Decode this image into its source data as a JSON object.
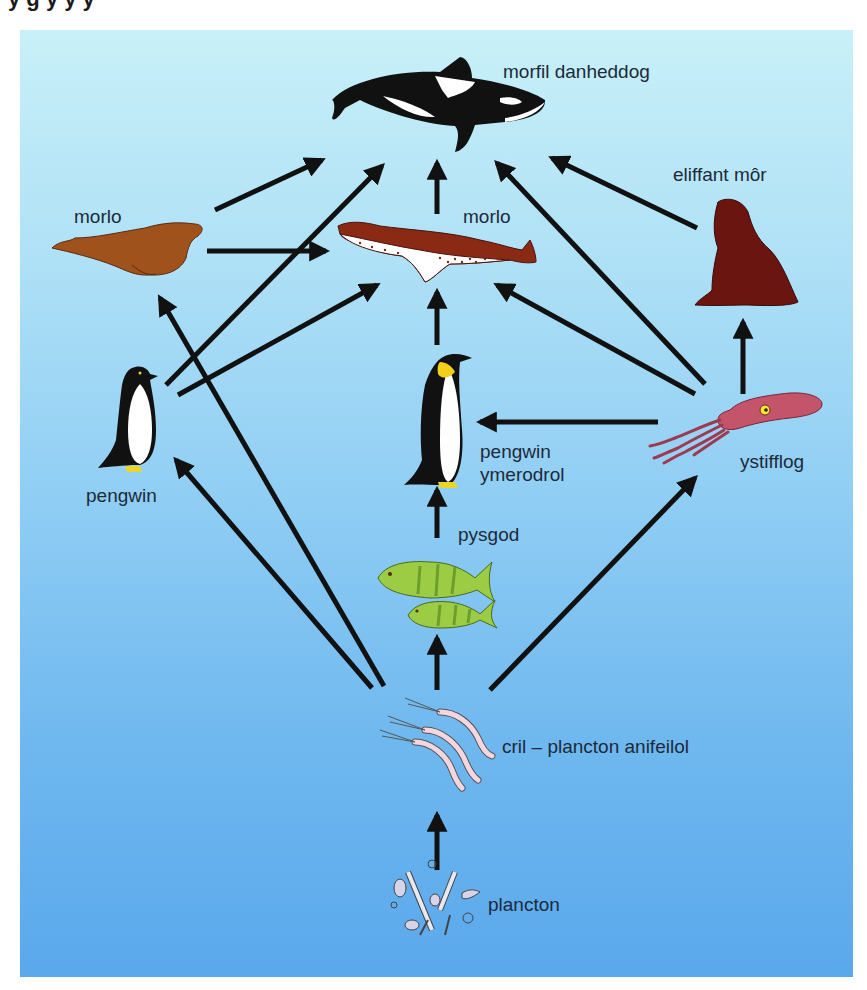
{
  "header": {
    "cut_off_title": "y     g         y y  y"
  },
  "diagram": {
    "background_colors": {
      "top": "#c8f0f8",
      "bottom": "#5aa8ec"
    },
    "arrow_color": "#111111",
    "nodes": [
      {
        "id": "orca",
        "label": "morfil danheddog"
      },
      {
        "id": "seal_brown",
        "label": "morlo"
      },
      {
        "id": "leopard_seal",
        "label": "morlo"
      },
      {
        "id": "elephant_seal",
        "label": "eliffant môr"
      },
      {
        "id": "penguin",
        "label": "pengwin"
      },
      {
        "id": "emperor_penguin",
        "label_line1": "pengwin",
        "label_line2": "ymerodrol"
      },
      {
        "id": "squid",
        "label": "ystifflog"
      },
      {
        "id": "fish",
        "label": "pysgod"
      },
      {
        "id": "krill",
        "label": "cril – plancton anifeilol"
      },
      {
        "id": "plankton",
        "label": "plancton"
      }
    ],
    "edges": [
      {
        "from": "seal_brown",
        "to": "orca"
      },
      {
        "from": "penguin",
        "to": "orca"
      },
      {
        "from": "penguin",
        "to": "leopard_seal"
      },
      {
        "from": "seal_brown",
        "to": "leopard_seal"
      },
      {
        "from": "krill",
        "to": "seal_brown"
      },
      {
        "from": "krill",
        "to": "penguin"
      },
      {
        "from": "leopard_seal",
        "to": "orca"
      },
      {
        "from": "emperor_penguin",
        "to": "leopard_seal"
      },
      {
        "from": "squid",
        "to": "orca"
      },
      {
        "from": "squid",
        "to": "leopard_seal"
      },
      {
        "from": "elephant_seal",
        "to": "orca"
      },
      {
        "from": "squid",
        "to": "emperor_penguin"
      },
      {
        "from": "squid",
        "to": "elephant_seal"
      },
      {
        "from": "fish",
        "to": "emperor_penguin"
      },
      {
        "from": "krill",
        "to": "fish"
      },
      {
        "from": "krill",
        "to": "squid"
      },
      {
        "from": "plankton",
        "to": "krill"
      }
    ]
  }
}
